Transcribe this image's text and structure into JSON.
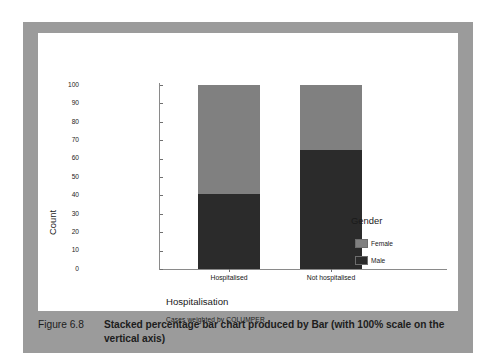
{
  "figure": {
    "caption_label": "Figure 6.8",
    "caption_text": "Stacked percentage bar chart produced by Bar (with 100% scale on the vertical axis)"
  },
  "colors": {
    "frame": "#9b9b9b",
    "plate": "#ffffff",
    "female": "#808080",
    "male": "#2b2b2b",
    "axis": "#8a8a8a",
    "text": "#1a1a1a"
  },
  "legend": {
    "title": "Gender",
    "items": [
      {
        "label": "Female",
        "color": "#808080"
      },
      {
        "label": "Male",
        "color": "#2b2b2b"
      }
    ]
  },
  "axes": {
    "ylabel": "Count",
    "xlabel": "Hospitalisation",
    "footnote": "Cases weighted by COLUMPER",
    "yticks": [
      "100",
      "90",
      "80",
      "70",
      "60",
      "50",
      "40",
      "30",
      "20",
      "10",
      "0"
    ]
  },
  "chart_data": {
    "type": "bar",
    "title": "",
    "subtitle": "Cases weighted by COLUMPER",
    "xlabel": "Hospitalisation",
    "ylabel": "Count",
    "ylim": [
      0,
      100
    ],
    "ytick_values": [
      0,
      10,
      20,
      30,
      40,
      50,
      60,
      70,
      80,
      90,
      100
    ],
    "grid": false,
    "stacked": true,
    "percentage_scale": true,
    "legend_title": "Gender",
    "legend_position": "right",
    "categories": [
      "Hospitalised",
      "Not hospitalised"
    ],
    "series": [
      {
        "name": "Male",
        "color": "#2b2b2b",
        "values": [
          40.5,
          64.5
        ]
      },
      {
        "name": "Female",
        "color": "#808080",
        "values": [
          59.5,
          35.5
        ]
      }
    ]
  }
}
